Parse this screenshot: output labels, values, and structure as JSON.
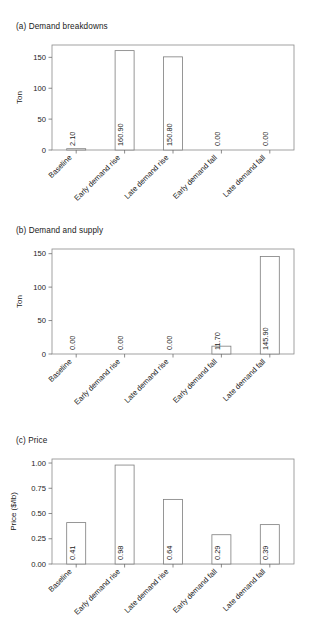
{
  "figure": {
    "panels": [
      {
        "id": "a",
        "title": "(a)  Demand breakdowns",
        "ylabel": "Ton"
      },
      {
        "id": "b",
        "title": "(b)  Demand and supply",
        "ylabel": "Ton"
      },
      {
        "id": "c",
        "title": "(c)  Price",
        "ylabel": "Price ($/lb)"
      }
    ]
  },
  "chart_data": [
    {
      "type": "bar",
      "title": "(a)  Demand breakdowns",
      "xlabel": "",
      "ylabel": "Ton",
      "ylim": [
        0,
        170
      ],
      "yticks": [
        0,
        50,
        100,
        150
      ],
      "ytick_labels": [
        "0",
        "50",
        "100",
        "150"
      ],
      "grid": false,
      "legend": "none",
      "categories": [
        "Baseline",
        "Early demand rise",
        "Late demand rise",
        "Early demand fall",
        "Late demand fall"
      ],
      "values": [
        2.1,
        160.9,
        150.8,
        0.0,
        0.0
      ],
      "value_labels": [
        "2.10",
        "160.90",
        "150.80",
        "0.00",
        "0.00"
      ]
    },
    {
      "type": "bar",
      "title": "(b)  Demand and supply",
      "xlabel": "",
      "ylabel": "Ton",
      "ylim": [
        0,
        157
      ],
      "yticks": [
        0,
        50,
        100,
        150
      ],
      "ytick_labels": [
        "0",
        "50",
        "100",
        "150"
      ],
      "grid": false,
      "legend": "none",
      "categories": [
        "Baseline",
        "Early demand rise",
        "Late demand rise",
        "Early demand fall",
        "Late demand fall"
      ],
      "values": [
        0.0,
        0.0,
        0.0,
        11.7,
        145.9
      ],
      "value_labels": [
        "0.00",
        "0.00",
        "0.00",
        "11.70",
        "145.90"
      ]
    },
    {
      "type": "bar",
      "title": "(c)  Price",
      "xlabel": "",
      "ylabel": "Price ($/lb)",
      "ylim": [
        0,
        1.04
      ],
      "yticks": [
        0,
        0.25,
        0.5,
        0.75,
        1.0
      ],
      "ytick_labels": [
        "0.00",
        "0.25",
        "0.50",
        "0.75",
        "1.00"
      ],
      "grid": false,
      "legend": "none",
      "categories": [
        "Baseline",
        "Early demand rise",
        "Late demand rise",
        "Early demand fall",
        "Late demand fall"
      ],
      "values": [
        0.41,
        0.98,
        0.64,
        0.29,
        0.39
      ],
      "value_labels": [
        "0.41",
        "0.98",
        "0.64",
        "0.29",
        "0.39"
      ]
    }
  ],
  "style": {
    "bar_fill": "#ffffff",
    "bar_stroke": "#7d7d7d",
    "frame_stroke": "#8a8a8a",
    "text_color": "#1a1a1a",
    "background": "#ffffff"
  }
}
